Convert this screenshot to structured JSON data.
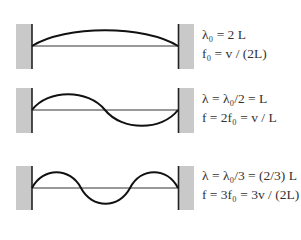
{
  "diagram": {
    "colors": {
      "wall": "#c8c8c8",
      "wall_edge": "#222222",
      "string": "#111111",
      "axis": "#333333"
    },
    "modes": [
      {
        "harmonic": 1,
        "line1": "λ₀ = 2 L",
        "line2": "f₀ = v / (2L)"
      },
      {
        "harmonic": 2,
        "line1": "λ = λ₀/2 = L",
        "line2": "f = 2f₀ = v / L"
      },
      {
        "harmonic": 3,
        "line1": "λ = λ₀/3 = (2/3) L",
        "line2": "f = 3f₀ = 3v / (2L)"
      }
    ]
  }
}
